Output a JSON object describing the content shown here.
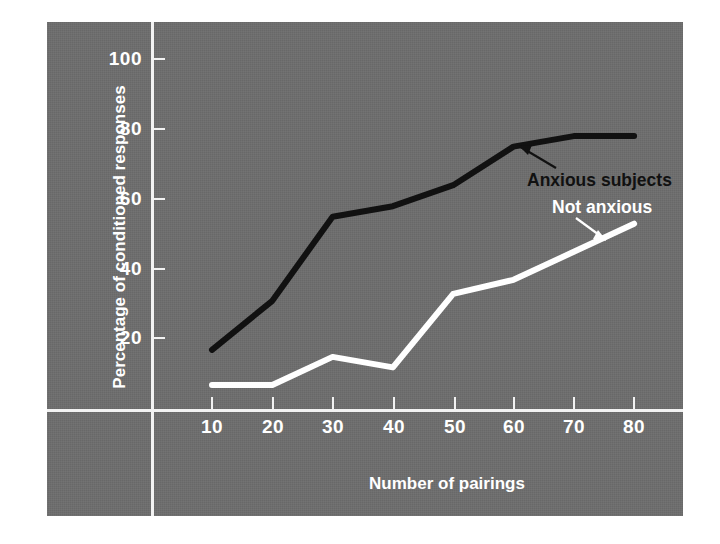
{
  "chart_data": {
    "type": "line",
    "title": "",
    "xlabel": "Number of pairings",
    "ylabel": "Percentage of conditioned responses",
    "xlim": [
      0,
      85
    ],
    "ylim": [
      0,
      105
    ],
    "xticks": [
      10,
      20,
      30,
      40,
      50,
      60,
      70,
      80
    ],
    "yticks": [
      20,
      40,
      60,
      80,
      100
    ],
    "grid": false,
    "legend_position": "inline-annotations",
    "background_color": "#6d6d6d",
    "x": [
      10,
      20,
      30,
      40,
      50,
      60,
      70,
      80
    ],
    "series": [
      {
        "name": "Anxious subjects",
        "color": "#111111",
        "values": [
          17,
          31,
          55,
          58,
          64,
          75,
          78,
          78
        ]
      },
      {
        "name": "Not anxious",
        "color": "#ffffff",
        "values": [
          7,
          7,
          15,
          12,
          33,
          37,
          45,
          53
        ]
      }
    ],
    "annotations": [
      {
        "text": "Anxious subjects",
        "color": "#111111",
        "points_to_series": "Anxious subjects"
      },
      {
        "text": "Not anxious",
        "color": "#ffffff",
        "points_to_series": "Not anxious"
      }
    ]
  },
  "axis": {
    "y_tick_labels": [
      "100",
      "80",
      "60",
      "40",
      "20"
    ],
    "x_tick_labels": [
      "10",
      "20",
      "30",
      "40",
      "50",
      "60",
      "70",
      "80"
    ],
    "y_title": "Percentage of conditioned responses",
    "x_title": "Number of pairings"
  },
  "annotations": {
    "anxious": "Anxious subjects",
    "not_anxious": "Not anxious"
  }
}
